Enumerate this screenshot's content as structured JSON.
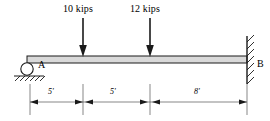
{
  "diagram": {
    "type": "beam-free-body-diagram",
    "colors": {
      "line": "#1a1a1a",
      "beam_fill": "#d9d9d9",
      "background": "#ffffff"
    },
    "supports": [
      {
        "id": "A",
        "label": "A",
        "kind": "roller-support",
        "position_ft": 0,
        "x_px": 27,
        "y_px": 66
      },
      {
        "id": "B",
        "label": "B",
        "kind": "fixed-support",
        "position_ft": 18,
        "x_px": 247,
        "y_px": 64
      }
    ],
    "loads": [
      {
        "id": "load-1",
        "label": "10 kips",
        "magnitude": 10,
        "units": "kips",
        "direction": "down",
        "position_ft": 5,
        "x_px": 83,
        "label_x_px": 63,
        "label_y_px": 4,
        "arrow_top_px": 18,
        "arrow_tip_px": 57
      },
      {
        "id": "load-2",
        "label": "12 kips",
        "magnitude": 12,
        "units": "kips",
        "direction": "down",
        "position_ft": 10,
        "x_px": 150,
        "label_x_px": 130,
        "label_y_px": 4,
        "arrow_top_px": 18,
        "arrow_tip_px": 57
      }
    ],
    "beam": {
      "x_start_px": 27,
      "x_end_px": 247,
      "y_top_px": 56,
      "y_bottom_px": 63,
      "span_ft": 18
    },
    "dimensions": [
      {
        "id": "dim-1",
        "label": "5'",
        "value": 5,
        "units": "ft",
        "x_start_px": 30,
        "x_end_px": 83,
        "label_x_px": 51,
        "y_px": 102
      },
      {
        "id": "dim-2",
        "label": "5'",
        "value": 5,
        "units": "ft",
        "x_start_px": 85,
        "x_end_px": 148,
        "label_x_px": 113,
        "y_px": 102
      },
      {
        "id": "dim-3",
        "label": "8'",
        "value": 8,
        "units": "ft",
        "x_start_px": 152,
        "x_end_px": 247,
        "label_x_px": 196,
        "y_px": 102
      }
    ],
    "extension_lines": [
      {
        "x_px": 30,
        "y_top_px": 84,
        "y_bottom_px": 115
      },
      {
        "x_px": 83,
        "y_top_px": 84,
        "y_bottom_px": 115
      },
      {
        "x_px": 150,
        "y_top_px": 84,
        "y_bottom_px": 115
      },
      {
        "x_px": 247,
        "y_top_px": 84,
        "y_bottom_px": 115
      }
    ],
    "ground_hatch": {
      "x_start_px": 14,
      "x_end_px": 44,
      "y_px": 76,
      "strokes": 6
    },
    "wall_hatch": {
      "x_px": 247,
      "y_top_px": 36,
      "y_bottom_px": 84,
      "strokes": 7
    }
  }
}
